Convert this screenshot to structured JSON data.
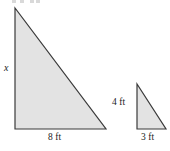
{
  "figure": {
    "background_color": "#ffffff",
    "fill_color": "#e3e3e3",
    "stroke_color": "#3a3a3a",
    "labels": {
      "large_height": "x",
      "large_base": "8 ft",
      "small_height": "4 ft",
      "small_base": "3 ft"
    },
    "shapes": [
      {
        "name": "large-triangle",
        "type": "right-triangle",
        "points": "15,8 15,129 106,129",
        "right_angle_at": "bottom-left",
        "legs": {
          "vertical": {
            "label": "x",
            "value": null,
            "unit": "ft"
          },
          "horizontal": {
            "label": "8 ft",
            "value": 8,
            "unit": "ft"
          }
        }
      },
      {
        "name": "small-triangle",
        "type": "right-triangle",
        "points": "137,84 137,129 166,129",
        "right_angle_at": "bottom-left",
        "legs": {
          "vertical": {
            "label": "4 ft",
            "value": 4,
            "unit": "ft"
          },
          "horizontal": {
            "label": "3 ft",
            "value": 3,
            "unit": "ft"
          }
        }
      }
    ]
  },
  "chart_data": {
    "type": "diagram",
    "shapes": [
      {
        "id": "large",
        "vertical_leg": "x",
        "horizontal_leg": 8,
        "unit": "ft"
      },
      {
        "id": "small",
        "vertical_leg": 4,
        "horizontal_leg": 3,
        "unit": "ft"
      }
    ]
  }
}
